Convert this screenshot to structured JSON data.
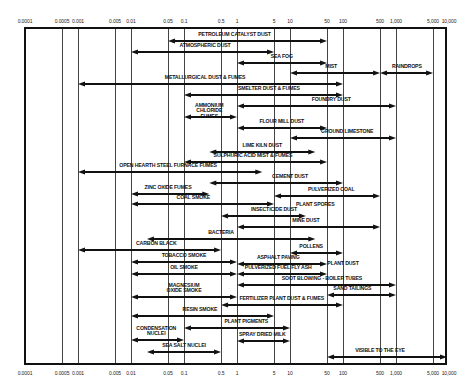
{
  "chart_data": {
    "type": "range-bar",
    "title": "",
    "xlabel": "Particle size (microns)",
    "ylabel": "",
    "x_scale": "log",
    "xlim": [
      0.0001,
      10000
    ],
    "ticks": [
      "0.0001",
      "0.0005",
      "0.001",
      "0.005",
      "0.01",
      "0.05",
      "0.1",
      "0.5",
      "1",
      "5",
      "10",
      "50",
      "100",
      "500",
      "1,000",
      "5,000",
      "10,000"
    ],
    "tick_values": [
      0.0001,
      0.0005,
      0.001,
      0.005,
      0.01,
      0.05,
      0.1,
      0.5,
      1,
      5,
      10,
      50,
      100,
      500,
      1000,
      5000,
      10000
    ],
    "grid": true,
    "bars": [
      {
        "label": "PETROLEUM CATALYST DUST",
        "start": 0.05,
        "end": 50,
        "y": 41,
        "label_x": 0.9
      },
      {
        "label": "ATMOSPHERIC DUST",
        "start": 0.01,
        "end": 5,
        "y": 52,
        "label_x": 0.25
      },
      {
        "label": "SEA FOG",
        "start": 1,
        "end": 50,
        "y": 63,
        "label_x": 7
      },
      {
        "label": "MIST",
        "start": 10,
        "end": 500,
        "y": 73,
        "label_x": 60
      },
      {
        "label": "RAINDROPS",
        "start": 500,
        "end": 5000,
        "y": 73,
        "label_x": 1600
      },
      {
        "label": "METALLURGICAL DUST & FUMES",
        "start": 0.001,
        "end": 100,
        "y": 84,
        "label_x": 0.25
      },
      {
        "label": "SMELTER DUST & FUMES",
        "start": 0.1,
        "end": 100,
        "y": 95,
        "label_x": 4
      },
      {
        "label": "FOUNDRY DUST",
        "start": 1,
        "end": 1000,
        "y": 106,
        "label_x": 60
      },
      {
        "label": "AMMONIUM CHLORIDE FUMES",
        "start": 0.1,
        "end": 1,
        "y": 117,
        "label_x": 0.3,
        "multiline": true
      },
      {
        "label": "FLOUR MILL DUST",
        "start": 1,
        "end": 50,
        "y": 128,
        "label_x": 7
      },
      {
        "label": "GROUND LIMESTONE",
        "start": 10,
        "end": 1000,
        "y": 138,
        "label_x": 120
      },
      {
        "label": "LIME KILN DUST",
        "start": 0.3,
        "end": 30,
        "y": 152,
        "label_x": 3
      },
      {
        "label": "SULPHURIC ACID MIST & FUMES",
        "start": 0.1,
        "end": 50,
        "y": 162,
        "label_x": 2
      },
      {
        "label": "OPEN HEARTH STEEL FURNACE FUMES",
        "start": 0.001,
        "end": 3,
        "y": 172,
        "label_x": 0.05
      },
      {
        "label": "CEMENT DUST",
        "start": 0.3,
        "end": 100,
        "y": 183,
        "label_x": 10
      },
      {
        "label": "ZINC OXIDE FUMES",
        "start": 0.01,
        "end": 0.3,
        "y": 194,
        "label_x": 0.05
      },
      {
        "label": "PULVERIZED COAL",
        "start": 5,
        "end": 500,
        "y": 196,
        "label_x": 60
      },
      {
        "label": "PLANT SPORES",
        "start": 10,
        "end": 200,
        "y": 205,
        "label_x": 30,
        "label_only": true
      },
      {
        "label": "COAL SMOKE",
        "start": 0.01,
        "end": 5,
        "y": 204,
        "label_x": 0.15
      },
      {
        "label": "INSECTICIDE DUST",
        "start": 0.5,
        "end": 20,
        "y": 216,
        "label_x": 5
      },
      {
        "label": "MINE DUST",
        "start": 1,
        "end": 500,
        "y": 227,
        "label_x": 20
      },
      {
        "label": "BACTERIA",
        "start": 0.02,
        "end": 30,
        "y": 239,
        "label_x": 0.5
      },
      {
        "label": "CARBON BLACK",
        "start": 0.001,
        "end": 0.5,
        "y": 250,
        "label_x": 0.03
      },
      {
        "label": "POLLENS",
        "start": 10,
        "end": 100,
        "y": 253,
        "label_x": 25
      },
      {
        "label": "PLANT DUST",
        "start": 50,
        "end": 200,
        "y": 264,
        "label_x": 100,
        "label_only": true
      },
      {
        "label": "TOBACCO SMOKE",
        "start": 0.01,
        "end": 1,
        "y": 262,
        "label_x": 0.1
      },
      {
        "label": "ASPHALT PAVING",
        "start": 1,
        "end": 50,
        "y": 264,
        "label_x": 6
      },
      {
        "label": "OIL SMOKE",
        "start": 0.01,
        "end": 1,
        "y": 274,
        "label_x": 0.1
      },
      {
        "label": "PULVERIZED FUEL FLY ASH",
        "start": 1,
        "end": 50,
        "y": 274,
        "label_x": 6
      },
      {
        "label": "SOOT BLOWING - BOILER TUBES",
        "start": 1,
        "end": 1000,
        "y": 285,
        "label_x": 40
      },
      {
        "label": "MAGNESIUM OXIDE SMOKE",
        "start": 0.01,
        "end": 1,
        "y": 297,
        "label_x": 0.1,
        "multiline": true
      },
      {
        "label": "SAND TAILINGS",
        "start": 50,
        "end": 1000,
        "y": 295,
        "label_x": 150
      },
      {
        "label": "FERTILIZER PLANT DUST & FUMES",
        "start": 0.5,
        "end": 100,
        "y": 305,
        "label_x": 7
      },
      {
        "label": "RESIN SMOKE",
        "start": 0.01,
        "end": 5,
        "y": 316,
        "label_x": 0.2
      },
      {
        "label": "PLANT PIGMENTS",
        "start": 0.1,
        "end": 10,
        "y": 328,
        "label_x": 1.5
      },
      {
        "label": "CONDENSATION NUCLEI",
        "start": 0.01,
        "end": 0.1,
        "y": 340,
        "label_x": 0.03,
        "multiline": true
      },
      {
        "label": "SPRAY DRIED MILK",
        "start": 1,
        "end": 10,
        "y": 341,
        "label_x": 3
      },
      {
        "label": "SEA SALT NUCLEI",
        "start": 0.02,
        "end": 0.5,
        "y": 352,
        "label_x": 0.1
      },
      {
        "label": "VISIBLE TO THE EYE",
        "start": 50,
        "end": 10000,
        "y": 357,
        "label_x": 500
      }
    ]
  }
}
